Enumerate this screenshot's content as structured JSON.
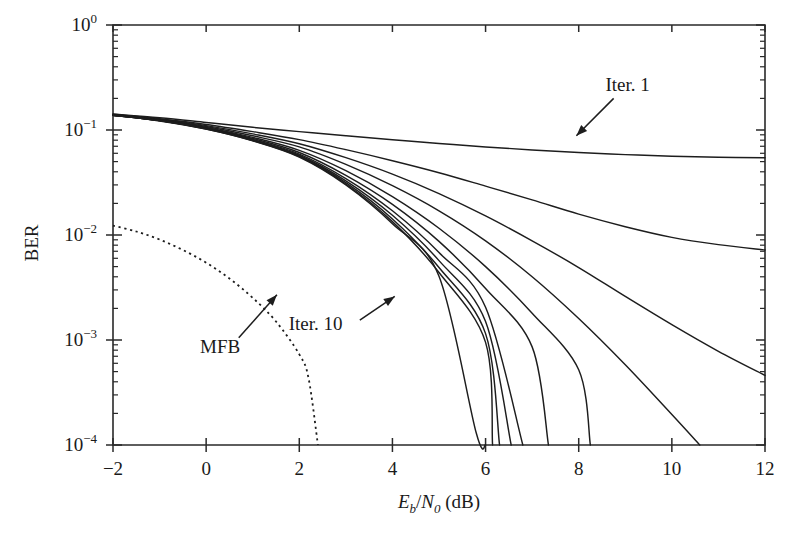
{
  "chart_data": {
    "type": "line",
    "title": "",
    "xlabel": "Eb/N0 (dB)",
    "ylabel": "BER",
    "xlabel_parts": {
      "main1": "E",
      "sub1": "b",
      "slash": "/",
      "main2": "N",
      "sub2": "0",
      "unit": " (dB)"
    },
    "xlim": [
      -2,
      12
    ],
    "ylim": [
      0.0001,
      1
    ],
    "yscale": "log",
    "grid": false,
    "legend": "none",
    "xticks": [
      -2,
      0,
      2,
      4,
      6,
      8,
      10,
      12
    ],
    "xticklabels": [
      "−2",
      "0",
      "2",
      "4",
      "6",
      "8",
      "10",
      "12"
    ],
    "yticks": [
      1,
      0.1,
      0.01,
      0.001,
      0.0001
    ],
    "yticklabels": [
      {
        "base": "10",
        "exp": "0"
      },
      {
        "base": "10",
        "exp": "−1"
      },
      {
        "base": "10",
        "exp": "−2"
      },
      {
        "base": "10",
        "exp": "−3"
      },
      {
        "base": "10",
        "exp": "−4"
      }
    ],
    "annotations": [
      {
        "text": "Iter. 1",
        "label_x": 9.05,
        "label_y": 0.235,
        "arrow_from_x": 8.75,
        "arrow_from_y": 0.2,
        "arrow_to_x": 7.95,
        "arrow_to_y": 0.088
      },
      {
        "text": "Iter. 10",
        "label_x": 2.35,
        "label_y": 0.00125,
        "arrow_from_x": 3.3,
        "arrow_from_y": 0.00155,
        "arrow_to_x": 4.05,
        "arrow_to_y": 0.0026
      },
      {
        "text": "MFB",
        "label_x": 0.3,
        "label_y": 0.00075,
        "arrow_from_x": 0.7,
        "arrow_from_y": 0.00105,
        "arrow_to_x": 1.52,
        "arrow_to_y": 0.0027
      }
    ],
    "series": [
      {
        "name": "Iter. 1",
        "style": "solid",
        "points": [
          [
            -2,
            0.142
          ],
          [
            -1,
            0.131
          ],
          [
            0,
            0.118
          ],
          [
            1,
            0.106
          ],
          [
            2,
            0.0965
          ],
          [
            3,
            0.0882
          ],
          [
            4,
            0.0808
          ],
          [
            5,
            0.0744
          ],
          [
            6,
            0.069
          ],
          [
            7,
            0.0646
          ],
          [
            8,
            0.061
          ],
          [
            9,
            0.0583
          ],
          [
            10,
            0.0563
          ],
          [
            11,
            0.0551
          ],
          [
            12,
            0.0545
          ]
        ]
      },
      {
        "name": "Iter. 2",
        "style": "solid",
        "points": [
          [
            -2,
            0.141
          ],
          [
            -1,
            0.128
          ],
          [
            0,
            0.113
          ],
          [
            1,
            0.0965
          ],
          [
            2,
            0.081
          ],
          [
            3,
            0.065
          ],
          [
            4,
            0.051
          ],
          [
            5,
            0.0392
          ],
          [
            6,
            0.0292
          ],
          [
            7,
            0.0216
          ],
          [
            8,
            0.0158
          ],
          [
            9,
            0.012
          ],
          [
            10,
            0.0095
          ],
          [
            11,
            0.0081
          ],
          [
            12,
            0.0072
          ]
        ]
      },
      {
        "name": "Iter. 3",
        "style": "solid",
        "points": [
          [
            -2,
            0.14
          ],
          [
            -1,
            0.127
          ],
          [
            0,
            0.11
          ],
          [
            1,
            0.0918
          ],
          [
            2,
            0.074
          ],
          [
            3,
            0.0545
          ],
          [
            4,
            0.038
          ],
          [
            5,
            0.0248
          ],
          [
            6,
            0.0152
          ],
          [
            7,
            0.0088
          ],
          [
            8,
            0.0049
          ],
          [
            9,
            0.0026
          ],
          [
            10,
            0.0014
          ],
          [
            11,
            0.00078
          ],
          [
            12,
            0.00046
          ]
        ]
      },
      {
        "name": "Iter. 4",
        "style": "solid",
        "points": [
          [
            -2,
            0.14
          ],
          [
            -1,
            0.126
          ],
          [
            0,
            0.108
          ],
          [
            1,
            0.088
          ],
          [
            2,
            0.069
          ],
          [
            3,
            0.047
          ],
          [
            4,
            0.0295
          ],
          [
            5,
            0.017
          ],
          [
            6,
            0.0088
          ],
          [
            7,
            0.004
          ],
          [
            8,
            0.0016
          ],
          [
            9,
            0.00058
          ],
          [
            10,
            0.000195
          ],
          [
            10.6,
            0.0001
          ]
        ]
      },
      {
        "name": "Iter. 5",
        "style": "solid",
        "points": [
          [
            -2,
            0.139
          ],
          [
            -1,
            0.125
          ],
          [
            0,
            0.106
          ],
          [
            1,
            0.085
          ],
          [
            2,
            0.064
          ],
          [
            3,
            0.041
          ],
          [
            4,
            0.0232
          ],
          [
            5,
            0.0116
          ],
          [
            6,
            0.005
          ],
          [
            7,
            0.0018
          ],
          [
            8,
            0.00052
          ],
          [
            8.25,
            0.0001
          ]
        ]
      },
      {
        "name": "Iter. 6",
        "style": "solid",
        "points": [
          [
            -2,
            0.139
          ],
          [
            -1,
            0.124
          ],
          [
            0,
            0.105
          ],
          [
            1,
            0.083
          ],
          [
            2,
            0.061
          ],
          [
            3,
            0.037
          ],
          [
            4,
            0.0196
          ],
          [
            5,
            0.0087
          ],
          [
            6,
            0.0031
          ],
          [
            7,
            0.00086
          ],
          [
            7.35,
            0.0001
          ]
        ]
      },
      {
        "name": "Iter. 7",
        "style": "solid",
        "points": [
          [
            -2,
            0.139
          ],
          [
            -1,
            0.124
          ],
          [
            0,
            0.104
          ],
          [
            1,
            0.0815
          ],
          [
            2,
            0.059
          ],
          [
            3,
            0.0345
          ],
          [
            4,
            0.017
          ],
          [
            5,
            0.0068
          ],
          [
            6,
            0.00205
          ],
          [
            6.8,
            0.0001
          ]
        ]
      },
      {
        "name": "Iter. 8",
        "style": "solid",
        "points": [
          [
            -2,
            0.138
          ],
          [
            -1,
            0.123
          ],
          [
            0,
            0.103
          ],
          [
            1,
            0.0805
          ],
          [
            2,
            0.0575
          ],
          [
            3,
            0.0328
          ],
          [
            4,
            0.0154
          ],
          [
            5,
            0.0057
          ],
          [
            6,
            0.0015
          ],
          [
            6.55,
            0.0001
          ]
        ]
      },
      {
        "name": "Iter. 9",
        "style": "solid",
        "points": [
          [
            -2,
            0.138
          ],
          [
            -1,
            0.123
          ],
          [
            0,
            0.103
          ],
          [
            1,
            0.0798
          ],
          [
            2,
            0.0565
          ],
          [
            3,
            0.0315
          ],
          [
            4,
            0.0142
          ],
          [
            5,
            0.0049
          ],
          [
            6,
            0.00115
          ],
          [
            6.3,
            0.0001
          ]
        ]
      },
      {
        "name": "Iter. 10",
        "style": "solid",
        "points": [
          [
            -2,
            0.138
          ],
          [
            -1,
            0.123
          ],
          [
            0,
            0.102
          ],
          [
            1,
            0.0792
          ],
          [
            2,
            0.0558
          ],
          [
            3,
            0.0306
          ],
          [
            4,
            0.0134
          ],
          [
            5,
            0.0044
          ],
          [
            6,
            0.00095
          ],
          [
            6.15,
            0.0001
          ]
        ]
      },
      {
        "name": "Iter. 11",
        "style": "solid",
        "points": [
          [
            -2,
            0.138
          ],
          [
            -1,
            0.122
          ],
          [
            0,
            0.102
          ],
          [
            1,
            0.0788
          ],
          [
            2,
            0.0552
          ],
          [
            3,
            0.03
          ],
          [
            4,
            0.0128
          ],
          [
            5,
            0.00405
          ],
          [
            5.8,
            0.00013
          ],
          [
            6.0,
            0.0001
          ]
        ]
      },
      {
        "name": "MFB",
        "style": "dotted",
        "points": [
          [
            -2,
            0.0123
          ],
          [
            -1.5,
            0.0108
          ],
          [
            -1,
            0.00905
          ],
          [
            -0.5,
            0.0072
          ],
          [
            0,
            0.00545
          ],
          [
            0.5,
            0.00385
          ],
          [
            1,
            0.00252
          ],
          [
            1.5,
            0.0015
          ],
          [
            2,
            0.00073
          ],
          [
            2.2,
            0.00043
          ],
          [
            2.4,
            0.0001
          ]
        ]
      }
    ]
  }
}
